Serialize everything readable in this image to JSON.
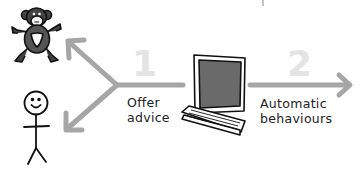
{
  "diagram": {
    "type": "flow",
    "colors": {
      "arrow": "#a6a6a6",
      "step_number": "#e4e4e4",
      "ink": "#111111",
      "screen": "#6a6a6a",
      "label_text": "#222222"
    },
    "nodes": [
      {
        "id": "monkey",
        "icon": "monkey-icon"
      },
      {
        "id": "person",
        "icon": "stick-figure-icon"
      },
      {
        "id": "computer",
        "icon": "computer-icon"
      }
    ],
    "steps": [
      {
        "number": "1",
        "label_line1": "Offer",
        "label_line2": "advice"
      },
      {
        "number": "2",
        "label_line1": "Automatic",
        "label_line2": "behaviours"
      }
    ],
    "edges": [
      {
        "from": "computer",
        "to": "monkey",
        "step": "1"
      },
      {
        "from": "computer",
        "to": "person",
        "step": "1"
      },
      {
        "from": "computer",
        "to": "right-edge",
        "step": "2"
      }
    ]
  }
}
